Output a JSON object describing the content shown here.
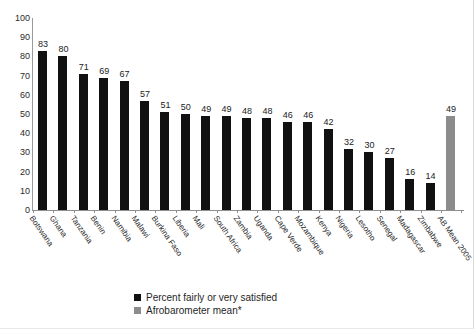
{
  "chart_data": {
    "type": "bar",
    "title": "",
    "xlabel": "",
    "ylabel": "",
    "ylim": [
      0,
      100
    ],
    "yticks": [
      100,
      90,
      80,
      70,
      60,
      50,
      40,
      30,
      20,
      10,
      0
    ],
    "grid": false,
    "legend_position": "bottom-center",
    "categories": [
      "Botswana",
      "Ghana",
      "Tanzania",
      "Benin",
      "Namibia",
      "Malawi",
      "Burkina Faso",
      "Liberia",
      "Mali",
      "South Africa",
      "Zambia",
      "Uganda",
      "Cape Verde",
      "Mozambique",
      "Kenya",
      "Nigeria",
      "Lesotho",
      "Senegal",
      "Madagascar",
      "Zimbabwe",
      "AB Mean 2005"
    ],
    "values": [
      83,
      80,
      71,
      69,
      67,
      57,
      51,
      50,
      49,
      49,
      48,
      48,
      46,
      46,
      42,
      32,
      30,
      27,
      16,
      14,
      49
    ],
    "series_of_point": [
      "country",
      "country",
      "country",
      "country",
      "country",
      "country",
      "country",
      "country",
      "country",
      "country",
      "country",
      "country",
      "country",
      "country",
      "country",
      "country",
      "country",
      "country",
      "country",
      "country",
      "mean"
    ],
    "legend": [
      {
        "label": "Percent fairly or very satisfied",
        "color": "#111111"
      },
      {
        "label": "Afrobarometer mean*",
        "color": "#8c8c8c"
      }
    ],
    "colors": {
      "bar": "#111111",
      "mean_bar": "#8c8c8c",
      "axis": "#8f8f8f",
      "text": "#222222",
      "background": "#ffffff"
    }
  }
}
